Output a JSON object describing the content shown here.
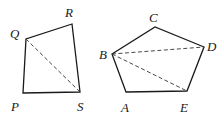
{
  "diagram": {
    "quadrilateral": {
      "name": "PQRS",
      "vertices": [
        {
          "label": "P",
          "x": 23,
          "y": 93,
          "lx": 11,
          "ly": 111
        },
        {
          "label": "Q",
          "x": 26,
          "y": 39,
          "lx": 10,
          "ly": 38
        },
        {
          "label": "R",
          "x": 72,
          "y": 24,
          "lx": 65,
          "ly": 17
        },
        {
          "label": "S",
          "x": 80,
          "y": 92,
          "lx": 77,
          "ly": 111
        }
      ],
      "diagonals": [
        [
          "Q",
          "S"
        ]
      ]
    },
    "pentagon": {
      "name": "ABCDE",
      "vertices": [
        {
          "label": "A",
          "x": 126,
          "y": 92,
          "lx": 121,
          "ly": 112
        },
        {
          "label": "B",
          "x": 112,
          "y": 54,
          "lx": 99,
          "ly": 59
        },
        {
          "label": "C",
          "x": 155,
          "y": 27,
          "lx": 149,
          "ly": 22
        },
        {
          "label": "D",
          "x": 204,
          "y": 47,
          "lx": 207,
          "ly": 51
        },
        {
          "label": "E",
          "x": 187,
          "y": 91,
          "lx": 180,
          "ly": 112
        }
      ],
      "diagonals": [
        [
          "B",
          "D"
        ],
        [
          "B",
          "E"
        ]
      ]
    },
    "colors": {
      "edge": "#1a1a1a",
      "diagonal": "#333333",
      "background": "#ffffff"
    }
  }
}
